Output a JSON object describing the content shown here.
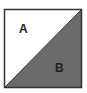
{
  "diagram": {
    "type": "square-split-by-diagonal",
    "regions": [
      {
        "label": "A",
        "fill": "#ffffff"
      },
      {
        "label": "B",
        "fill": "#6b6b6b"
      }
    ],
    "border_color": "#333333"
  }
}
